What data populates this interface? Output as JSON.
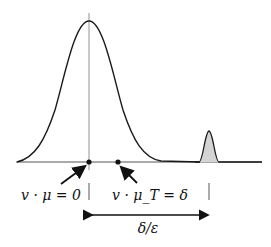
{
  "diagram": {
    "labels": {
      "origin_label": "v · μ = 0",
      "target_label": "v · μ_T = δ",
      "distance_label": "δ/ε"
    },
    "colors": {
      "curve": "#1a1a1a",
      "axis": "#555555",
      "spike_fill": "#d4d4d4",
      "vertical_line": "#777777"
    }
  }
}
